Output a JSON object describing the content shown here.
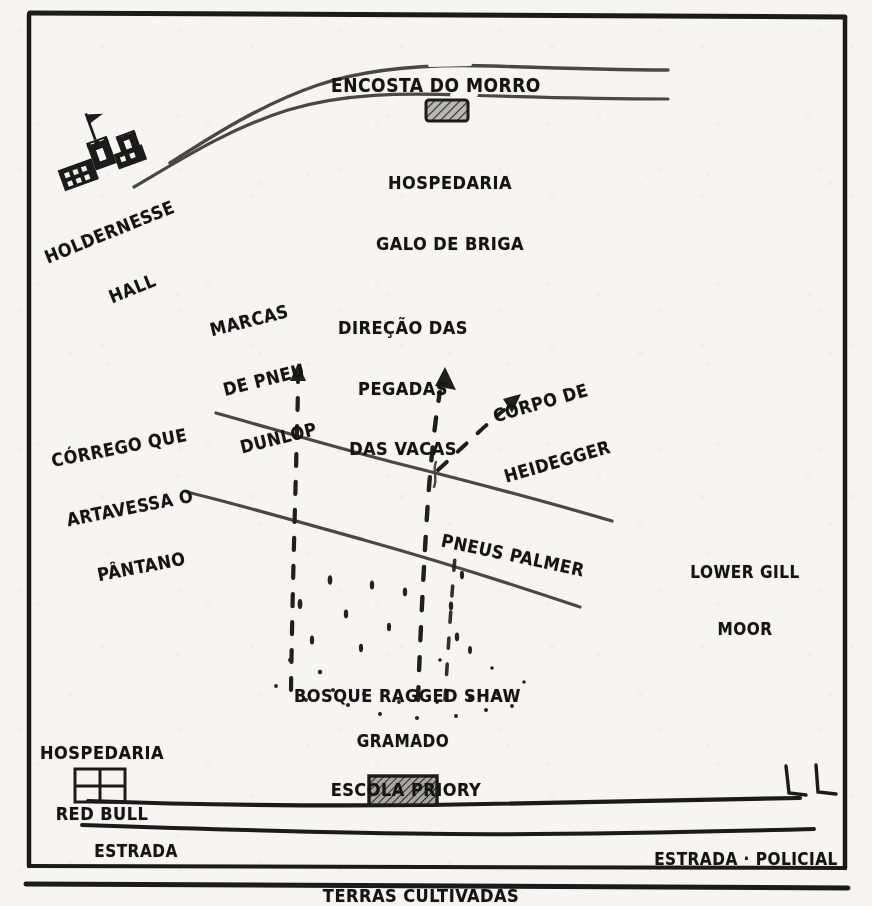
{
  "map": {
    "title": "Mapa desenhado a mão — Holdernesse Hall e arredores",
    "style": "hand-drawn ink sketch on off-white paper",
    "colors": {
      "paper": "#f6f5f2",
      "ink": "#141414",
      "line": "#3a3a38",
      "hatch": "#2a2a28"
    },
    "frame": {
      "present": true,
      "double_rule_bottom": true
    }
  },
  "labels": {
    "hill_slope": {
      "text": "ENCOSTA DO MORRO",
      "lines": [
        "ENCOSTA DO MORRO"
      ],
      "rotation": 0
    },
    "holdernesse": {
      "text": "HOLDERNESSE HALL",
      "lines": [
        "HOLDERNESSE",
        "HALL"
      ],
      "rotation": -22
    },
    "galo_de_briga": {
      "text": "HOSPEDARIA GALO DE BRIGA",
      "lines": [
        "HOSPEDARIA",
        "GALO DE BRIGA"
      ],
      "rotation": 0
    },
    "dunlop": {
      "text": "MARCAS DE PNEU DUNLOP",
      "lines": [
        "MARCAS",
        "DE PNEU",
        "DUNLOP"
      ],
      "rotation": -14
    },
    "cow_tracks": {
      "text": "DIREÇÃO DAS PEGADAS DAS VACAS",
      "lines": [
        "DIREÇÃO DAS",
        "PEGADAS",
        "DAS VACAS"
      ],
      "rotation": 0
    },
    "heidegger_body": {
      "text": "CORPO DE HEIDEGGER",
      "lines": [
        "CORPO DE",
        "HEIDEGGER"
      ],
      "rotation": -16
    },
    "stream": {
      "text": "CÓRREGO QUE ARTAVESSA O PÂNTANO",
      "lines": [
        "CÓRREGO QUE",
        "ARTAVESSA O",
        "PÂNTANO"
      ],
      "rotation": -11
    },
    "palmer_tyres": {
      "text": "PNEUS PALMER",
      "lines": [
        "PNEUS PALMER"
      ],
      "rotation": 12
    },
    "lower_gill_moor": {
      "text": "LOWER GILL MOOR",
      "lines": [
        "LOWER GILL",
        "MOOR"
      ],
      "rotation": 0
    },
    "ragged_shaw": {
      "text": "BOSQUE RAGGED SHAW",
      "lines": [
        "BOSQUE RAGGED SHAW"
      ],
      "rotation": 0
    },
    "grassland": {
      "text": "GRAMADO",
      "lines": [
        "GRAMADO"
      ],
      "rotation": 0
    },
    "red_bull": {
      "text": "HOSPEDARIA RED BULL",
      "lines": [
        "HOSPEDARIA",
        "RED BULL"
      ],
      "rotation": 0
    },
    "priory_school": {
      "text": "ESCOLA PRIORY",
      "lines": [
        "ESCOLA PRIORY"
      ],
      "rotation": 0
    },
    "road_left": {
      "text": "ESTRADA",
      "lines": [
        "ESTRADA"
      ],
      "rotation": 0
    },
    "road_right": {
      "text": "ESTRADA · POLICIAL",
      "lines": [
        "ESTRADA · POLICIAL"
      ],
      "rotation": 0
    },
    "farmland": {
      "text": "TERRAS CULTIVADAS",
      "lines": [
        "TERRAS CULTIVADAS"
      ],
      "rotation": 0
    }
  },
  "features": {
    "buildings": [
      {
        "name": "holdernesse-hall-icon",
        "kind": "castle-with-flag"
      },
      {
        "name": "galo-de-briga-icon",
        "kind": "hatched-block"
      },
      {
        "name": "red-bull-inn-icon",
        "kind": "grid-block"
      },
      {
        "name": "priory-school-icon",
        "kind": "hatched-block"
      }
    ],
    "arrows": [
      {
        "name": "dunlop-track-arrow",
        "points_to": "MARCAS DE PNEU DUNLOP",
        "style": "dashed-vertical"
      },
      {
        "name": "cow-track-arrow",
        "points_to": "DIREÇÃO DAS PEGADAS DAS VACAS",
        "style": "dashed-vertical"
      },
      {
        "name": "heidegger-body-arrow",
        "points_to": "CORPO DE HEIDEGGER",
        "style": "dashed-diagonal"
      }
    ],
    "lines": [
      {
        "name": "hill-ridge-upper",
        "style": "solid-curve"
      },
      {
        "name": "hill-ridge-lower",
        "style": "solid-curve"
      },
      {
        "name": "stream-bank-upper",
        "style": "solid-diagonal"
      },
      {
        "name": "stream-bank-lower",
        "style": "solid-diagonal"
      },
      {
        "name": "main-road",
        "style": "solid-horizontal"
      },
      {
        "name": "secondary-road",
        "style": "solid-horizontal"
      }
    ],
    "textures": [
      {
        "name": "woodland-dot-scatter",
        "where": "Bosque Ragged Shaw / Gramado"
      }
    ]
  }
}
